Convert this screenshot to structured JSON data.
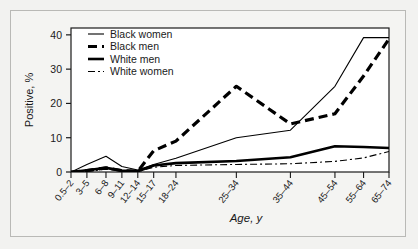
{
  "chart_data": {
    "type": "line",
    "title": "",
    "xlabel": "Age, y",
    "ylabel": "Positive, %",
    "ylim": [
      0,
      42
    ],
    "yticks": [
      0,
      10,
      20,
      30,
      40
    ],
    "ytick_labels": [
      "0",
      "10",
      "20",
      "30",
      "40"
    ],
    "grid": false,
    "legend_position": "top-left",
    "categories": [
      "0.5–2",
      "3–5",
      "6–8",
      "9–11",
      "12–14",
      "15–17",
      "18–24",
      "25–34",
      "35–44",
      "45–54",
      "55–64",
      "65–74"
    ],
    "category_positions": [
      0,
      5,
      11,
      16,
      21,
      26,
      33,
      52,
      69,
      83,
      92,
      100
    ],
    "series": [
      {
        "name": "Black women",
        "style": "thin-solid",
        "color": "#000000",
        "width": 1.1,
        "dash": "none",
        "values": [
          0,
          2.2,
          4.6,
          1.6,
          0.6,
          2.2,
          4.0,
          10.0,
          12.2,
          25.0,
          39.2,
          39.2
        ]
      },
      {
        "name": "Black men",
        "style": "thick-dashed",
        "color": "#000000",
        "width": 3.2,
        "dash": "9,5",
        "values": [
          0,
          0.4,
          1.2,
          0.4,
          0.2,
          6.2,
          9.0,
          25.0,
          14.0,
          17.0,
          28.0,
          38.8
        ]
      },
      {
        "name": "White men",
        "style": "thick-solid",
        "color": "#000000",
        "width": 2.6,
        "dash": "none",
        "values": [
          0,
          0.5,
          1.2,
          0.4,
          0.2,
          1.9,
          2.6,
          3.2,
          4.3,
          7.5,
          7.3,
          7.0
        ]
      },
      {
        "name": "White women",
        "style": "thin-dashdot",
        "color": "#000000",
        "width": 1.1,
        "dash": "7,3,2,3",
        "values": [
          0,
          0.2,
          0.8,
          0.3,
          0.1,
          1.4,
          1.9,
          2.2,
          2.4,
          3.1,
          4.1,
          6.0
        ]
      }
    ]
  },
  "legend": {
    "items": [
      {
        "label": "Black women"
      },
      {
        "label": "Black men"
      },
      {
        "label": "White men"
      },
      {
        "label": "White women"
      }
    ]
  }
}
